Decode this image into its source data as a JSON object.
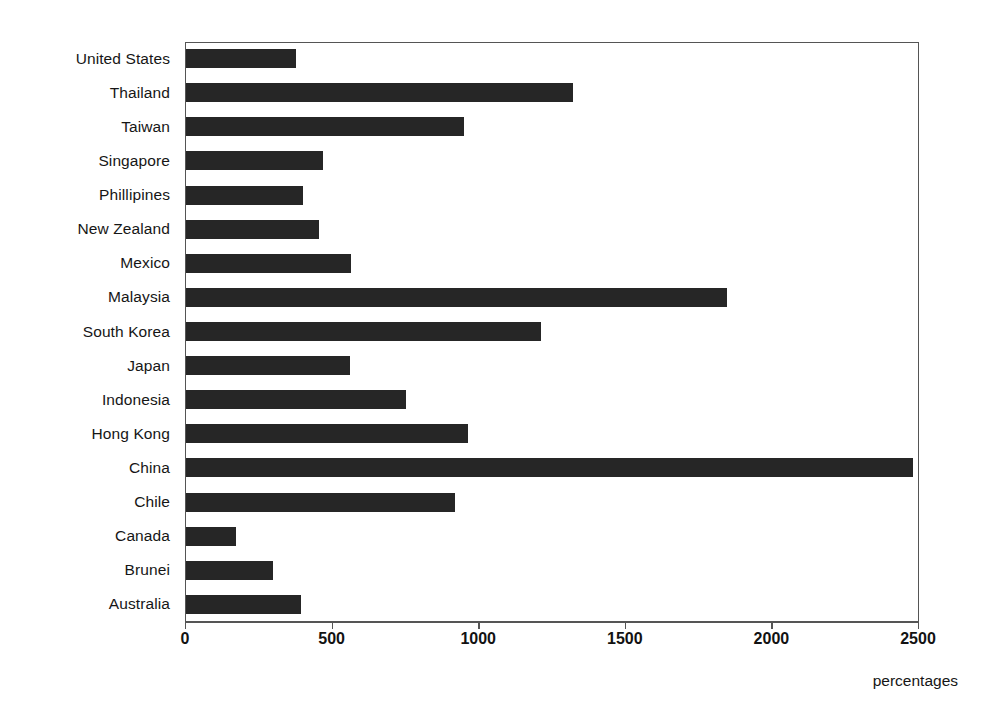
{
  "chart_data": {
    "type": "bar",
    "orientation": "horizontal",
    "title": "",
    "subtitle": "",
    "xlabel": "percentages",
    "ylabel": "",
    "xlim": [
      0,
      2500
    ],
    "xticks": [
      0,
      500,
      1000,
      1500,
      2000,
      2500
    ],
    "xtick_labels": [
      "0",
      "500",
      "1000",
      "1500",
      "2000",
      "2500"
    ],
    "grid": false,
    "legend": null,
    "bar_color": "#262626",
    "axis_color": "#555555",
    "background": "#ffffff",
    "categories": [
      "United States",
      "Thailand",
      "Taiwan",
      "Singapore",
      "Phillipines",
      "New Zealand",
      "Mexico",
      "Malaysia",
      "South Korea",
      "Japan",
      "Indonesia",
      "Hong Kong",
      "China",
      "Chile",
      "Canada",
      "Brunei",
      "Australia"
    ],
    "values": [
      375,
      1320,
      948,
      467,
      400,
      454,
      563,
      1845,
      1211,
      560,
      750,
      962,
      2480,
      918,
      170,
      297,
      392
    ]
  }
}
